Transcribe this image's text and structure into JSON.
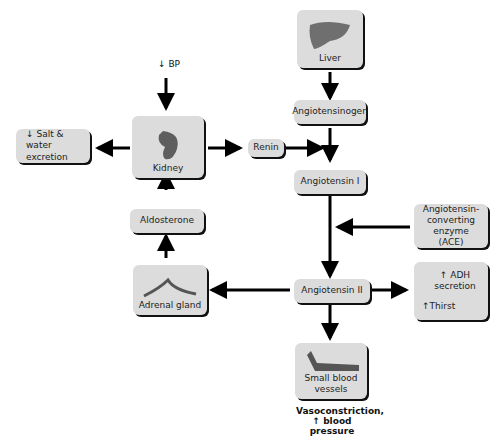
{
  "nodes": {
    "liver": "Liver",
    "angiotensinogen": "Angiotensinogen",
    "renin": "Renin",
    "angiotensin1": "Angiotensin I",
    "kidney": "Kidney",
    "salt_water": "Salt & water excretion",
    "salt_arrow": "↓",
    "aldosterone": "Aldosterone",
    "adrenal": "Adrenal gland",
    "ace_line1": "Angiotensin-",
    "ace_line2": "converting enzyme",
    "ace_line3": "(ACE)",
    "angiotensin2": "Angiotensin II",
    "adh": "ADH secretion",
    "thirst": "Thirst",
    "up_arrow": "↑",
    "vessels_line1": "Small blood",
    "vessels_line2": "vessels"
  },
  "labels": {
    "bp_arrow": "↓",
    "bp": "BP",
    "vaso_line1": "Vasoconstriction,",
    "vaso_line2": "blood pressure",
    "vaso_arrow": "↑"
  }
}
